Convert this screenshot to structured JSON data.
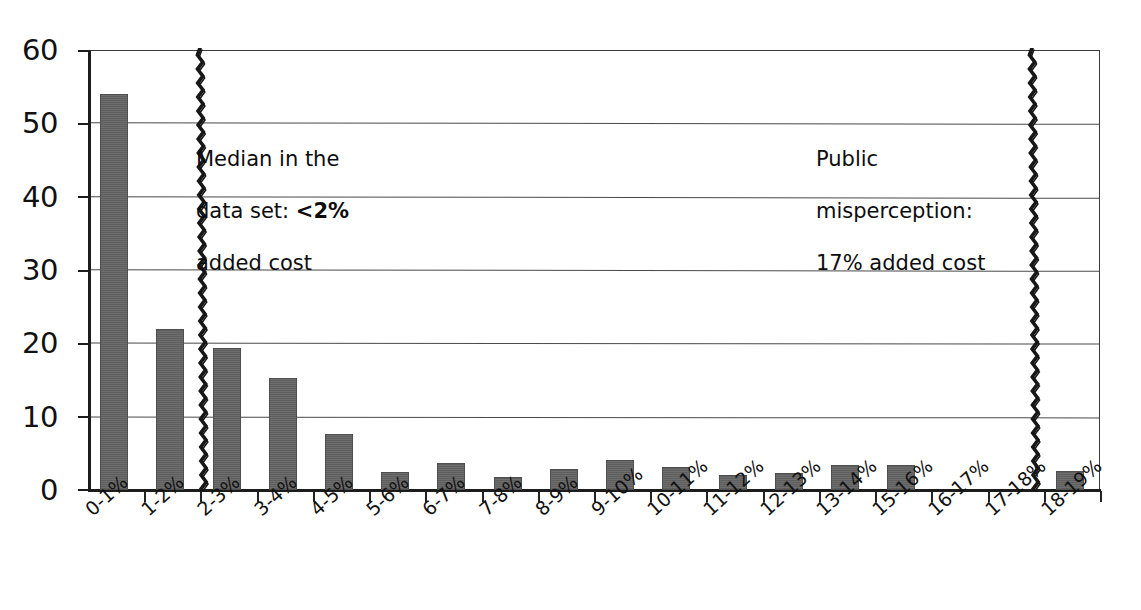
{
  "chart_data": {
    "type": "bar",
    "title": "",
    "subtitle": "",
    "xlabel": "",
    "ylabel": "",
    "ylim": [
      0,
      60
    ],
    "yticks": [
      0,
      10,
      20,
      30,
      40,
      50,
      60
    ],
    "grid": true,
    "legend": "none",
    "categories": [
      "0-1%",
      "1-2%",
      "2-3%",
      "3-4%",
      "4-5%",
      "5-6%",
      "6-7%",
      "7-8%",
      "8-9%",
      "9-10%",
      "10-11%",
      "11-12%",
      "12-13%",
      "13-14%",
      "15-16%",
      "16-17%",
      "17-18%",
      "18-19%"
    ],
    "values": [
      54.0,
      22.0,
      19.3,
      15.3,
      7.6,
      2.5,
      3.7,
      1.8,
      2.8,
      4.1,
      3.1,
      2.1,
      2.3,
      3.4,
      3.4,
      0,
      0,
      2.6
    ],
    "annotations": [
      {
        "name": "median-marker",
        "category": "1-2%",
        "lines": [
          "Median in the",
          "data set: ",
          "<2%",
          "added cost"
        ],
        "text_line_1": "Median in the",
        "text_line_2_prefix": "data set: ",
        "text_line_2_bold": "<2%",
        "text_line_3": "added cost"
      },
      {
        "name": "public-misperception-marker",
        "category": "17-18%",
        "lines": [
          "Public",
          "misperception:",
          "17% added cost"
        ],
        "text_line_1": "Public",
        "text_line_2": "misperception:",
        "text_line_3": "17% added cost"
      }
    ]
  },
  "axis": {
    "y_tick_labels": [
      "60",
      "50",
      "40",
      "30",
      "20",
      "10",
      "0"
    ]
  },
  "colors": {
    "bar_fill": "#646464",
    "bar_edge": "#4f4f4f",
    "axis": "#1c1c1c",
    "grid": "#4a4a4a",
    "text": "#111111",
    "marker": "#171717",
    "background": "#ffffff"
  }
}
